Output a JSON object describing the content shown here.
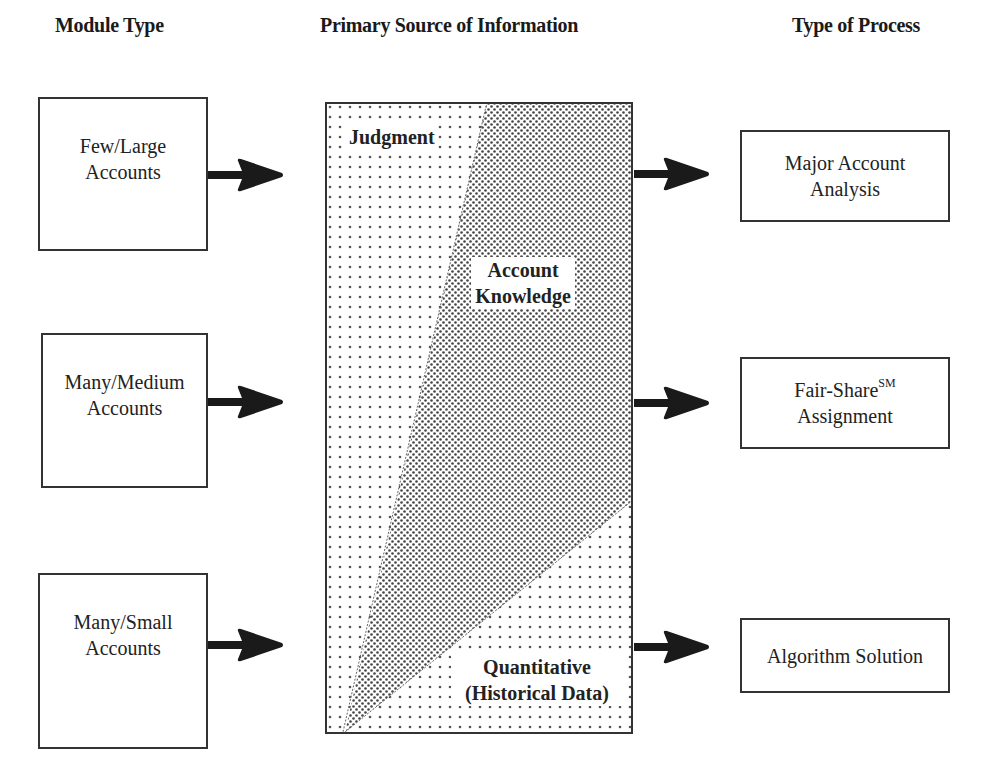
{
  "headers": {
    "module_type": "Module Type",
    "primary_source": "Primary Source of Information",
    "type_of_process": "Type of Process"
  },
  "module_types": [
    {
      "line1": "Few/Large",
      "line2": "Accounts"
    },
    {
      "line1": "Many/Medium",
      "line2": "Accounts"
    },
    {
      "line1": "Many/Small",
      "line2": "Accounts"
    }
  ],
  "information_sources": {
    "judgment": "Judgment",
    "account_knowledge_line1": "Account",
    "account_knowledge_line2": "Knowledge",
    "quantitative_line1": "Quantitative",
    "quantitative_line2": "(Historical Data)"
  },
  "processes": [
    {
      "line1": "Major Account",
      "line2": "Analysis"
    },
    {
      "line1": "Fair-Share",
      "sup": "SM",
      "line2": "Assignment"
    },
    {
      "line1": "Algorithm Solution"
    }
  ],
  "colors": {
    "border": "#333333",
    "arrow": "#1a1a1a",
    "dots": "#555555"
  }
}
